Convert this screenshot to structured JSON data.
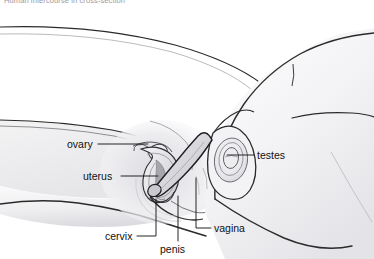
{
  "image": {
    "width": 374,
    "height": 259,
    "kind": "anatomical-line-drawing",
    "subject": "median sagittal cross-section of human sexual intercourse",
    "style": "grayscale pen-and-ink medical illustration with airbrush shading"
  },
  "caption": {
    "text": "Human intercourse in cross-section",
    "visible": "clipped at top edge of image"
  },
  "labels": [
    {
      "id": "ovary",
      "text": "ovary",
      "x": 67,
      "y": 140,
      "align": "left",
      "leader": "horizontal line running right to the ovary"
    },
    {
      "id": "uterus",
      "text": "uterus",
      "x": 83,
      "y": 172,
      "align": "left",
      "leader": "horizontal line running right to the uterus body"
    },
    {
      "id": "testes",
      "text": "testes",
      "x": 257,
      "y": 151,
      "align": "left",
      "leader": "horizontal line running left to the testis oval"
    },
    {
      "id": "cervix",
      "text": "cervix",
      "x": 105,
      "y": 233,
      "align": "left",
      "leader": "short horizontal then vertical line up to the cervix"
    },
    {
      "id": "penis",
      "text": "penis",
      "x": 160,
      "y": 246,
      "align": "left",
      "leader": "vertical line up to the penile shaft"
    },
    {
      "id": "vagina",
      "text": "vagina",
      "x": 214,
      "y": 225,
      "align": "left",
      "leader": "short horizontal then vertical line up to the vaginal canal"
    }
  ],
  "structures": [
    "female body in profile, reclining, left side of frame",
    "male body in profile, overlying from the right",
    "uterus with endometrial cavity",
    "ovary with fallopian tube",
    "cervix at the uterine neck",
    "vaginal canal",
    "penis inserted into the vagina",
    "testis shown as concentric oval within the scrotum"
  ],
  "colors": {
    "background": "#ffffff",
    "ink": "#1a1a1a",
    "mid_ink": "#6b6b6b",
    "light_ink": "#b4b4b4",
    "skin_shade_light": "#f4f4f5",
    "skin_shade_mid": "#e2e2e4",
    "skin_shade_dark": "#c8c8cc",
    "label_text": "#111111",
    "caption_text": "#9a9aa2"
  }
}
